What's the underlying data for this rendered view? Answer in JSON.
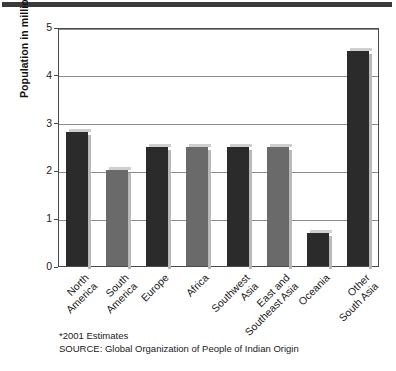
{
  "figure": {
    "top_rule": "decorative-rule",
    "footnotes": [
      "*2001 Estimates",
      "SOURCE: Global Organization of People of Indian Origin"
    ]
  },
  "chart_data": {
    "type": "bar",
    "title": "",
    "xlabel": "",
    "ylabel": "Population in millions*",
    "ylim": [
      0,
      5
    ],
    "yticks": [
      0,
      1,
      2,
      3,
      4,
      5
    ],
    "ytick_labels": [
      "0",
      "1",
      "2",
      "3",
      "4",
      "5"
    ],
    "grid": true,
    "grid_axis": "y",
    "legend": false,
    "categories": [
      "North America",
      "South America",
      "Europe",
      "Africa",
      "Southwest Asia",
      "East and Southeast Asia",
      "Oceania",
      "Other South Asia"
    ],
    "category_lines": [
      [
        "North",
        "America"
      ],
      [
        "South",
        "America"
      ],
      [
        "Europe",
        ""
      ],
      [
        "Africa",
        ""
      ],
      [
        "Southwest",
        "Asia"
      ],
      [
        "East and",
        "Southeast Asia"
      ],
      [
        "Oceania",
        ""
      ],
      [
        "Other",
        "South Asia"
      ]
    ],
    "values": [
      2.8,
      2.0,
      2.5,
      2.5,
      2.5,
      2.5,
      0.7,
      4.5
    ],
    "bar_colors": [
      "#2b2b2b",
      "#6a6a6a",
      "#2b2b2b",
      "#6a6a6a",
      "#2b2b2b",
      "#6a6a6a",
      "#2b2b2b",
      "#2b2b2b"
    ]
  }
}
